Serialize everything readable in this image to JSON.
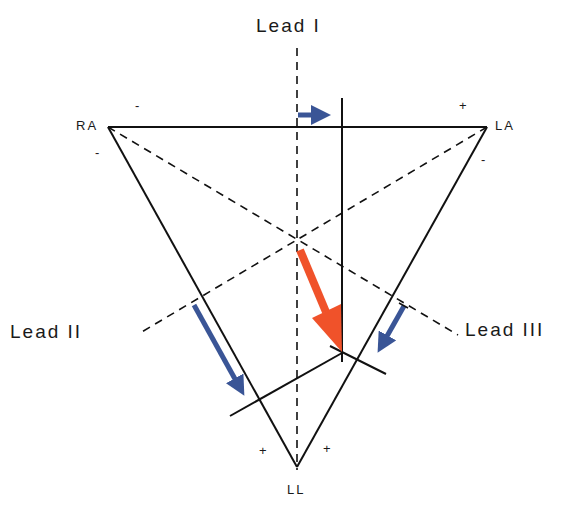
{
  "leads": {
    "lead1": "Lead I",
    "lead2": "Lead II",
    "lead3": "Lead III"
  },
  "electrodes": {
    "ra": "RA",
    "la": "LA",
    "ll": "LL"
  },
  "polarity": {
    "ra_top": "-",
    "ra_side": "-",
    "la_top": "+",
    "la_side": "-",
    "ll_left": "+",
    "ll_right": "+"
  },
  "colors": {
    "line": "#111111",
    "mean_vector": "#f0522a",
    "projection": "#3a5596"
  },
  "vectors": {
    "mean_vector": "Mean electrical axis vector",
    "projection_lead1": "Projection on Lead I",
    "projection_lead2": "Projection on Lead II",
    "projection_lead3": "Projection on Lead III"
  }
}
